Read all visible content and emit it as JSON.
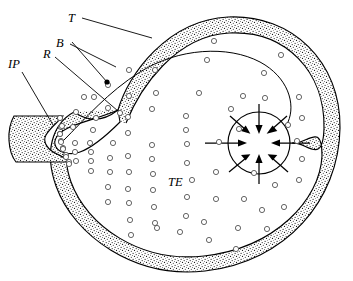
{
  "figure": {
    "background_color": "#ffffff",
    "ink_color": "#000000",
    "width": 353,
    "height": 281
  },
  "labels": [
    {
      "id": "T",
      "text": "T",
      "x": 68,
      "y": 22,
      "name": "label-t"
    },
    {
      "id": "B",
      "text": "B",
      "x": 56,
      "y": 47,
      "name": "label-b"
    },
    {
      "id": "R",
      "text": "R",
      "x": 43,
      "y": 58,
      "name": "label-r"
    },
    {
      "id": "IP",
      "text": "IP",
      "x": 8,
      "y": 68,
      "name": "label-ip"
    },
    {
      "id": "TE",
      "text": "TE",
      "x": 168,
      "y": 186,
      "name": "label-te"
    }
  ],
  "leaders": [
    {
      "id": "leader-t",
      "from_label": "T",
      "path": "M 82 18 L 152 38"
    },
    {
      "id": "leader-b",
      "from_label": "B",
      "path": "M 70 44 L 116 67"
    },
    {
      "id": "leader-r",
      "from_label": "R",
      "path": "M 55 57 L 118 111"
    },
    {
      "id": "leader-ip",
      "from_label": "IP",
      "path": "M 22 72 L 53 125"
    },
    {
      "id": "leader-dot",
      "from_label": "B",
      "path": "M 72 42 L 107 82",
      "end_dot": true
    }
  ],
  "structures": {
    "outer_coat": {
      "name": "outer-seed-coat",
      "texture": "stipple",
      "stipple_density": 2300
    },
    "integument_block": {
      "name": "integument-block-ip",
      "texture": "stipple"
    },
    "inner_membrane": {
      "name": "inner-membrane-line"
    },
    "nucleus": {
      "name": "nucleus-circle",
      "cx": 259,
      "cy": 143,
      "r": 31,
      "arrow_count": 8,
      "arrow_direction": "inward"
    },
    "micropyle": {
      "name": "micropyle-notch"
    }
  },
  "vesicles": {
    "name": "vesicle-dots",
    "radius": 2.6,
    "count": 84,
    "points": [
      [
        214,
        41
      ],
      [
        281,
        55
      ],
      [
        155,
        70
      ],
      [
        207,
        60
      ],
      [
        264,
        73
      ],
      [
        129,
        70
      ],
      [
        94,
        97
      ],
      [
        243,
        96
      ],
      [
        265,
        98
      ],
      [
        299,
        97
      ],
      [
        108,
        85
      ],
      [
        156,
        93
      ],
      [
        199,
        93
      ],
      [
        231,
        109
      ],
      [
        152,
        109
      ],
      [
        108,
        108
      ],
      [
        84,
        97
      ],
      [
        76,
        112
      ],
      [
        60,
        118
      ],
      [
        96,
        118
      ],
      [
        120,
        113
      ],
      [
        129,
        96
      ],
      [
        186,
        116
      ],
      [
        219,
        142
      ],
      [
        297,
        141
      ],
      [
        302,
        118
      ],
      [
        73,
        127
      ],
      [
        93,
        130
      ],
      [
        128,
        133
      ],
      [
        113,
        143
      ],
      [
        61,
        127
      ],
      [
        60,
        134
      ],
      [
        61,
        141
      ],
      [
        63,
        148
      ],
      [
        66,
        155
      ],
      [
        69,
        162
      ],
      [
        75,
        143
      ],
      [
        75,
        152
      ],
      [
        76,
        161
      ],
      [
        90,
        143
      ],
      [
        91,
        152
      ],
      [
        91,
        161
      ],
      [
        128,
        117
      ],
      [
        152,
        145
      ],
      [
        187,
        144
      ],
      [
        216,
        172
      ],
      [
        254,
        173
      ],
      [
        244,
        199
      ],
      [
        91,
        171
      ],
      [
        110,
        158
      ],
      [
        110,
        172
      ],
      [
        128,
        156
      ],
      [
        129,
        172
      ],
      [
        152,
        159
      ],
      [
        153,
        174
      ],
      [
        187,
        163
      ],
      [
        192,
        180
      ],
      [
        108,
        187
      ],
      [
        128,
        189
      ],
      [
        153,
        190
      ],
      [
        187,
        197
      ],
      [
        216,
        199
      ],
      [
        262,
        210
      ],
      [
        275,
        185
      ],
      [
        299,
        180
      ],
      [
        108,
        202
      ],
      [
        129,
        203
      ],
      [
        154,
        207
      ],
      [
        130,
        220
      ],
      [
        155,
        223
      ],
      [
        186,
        216
      ],
      [
        204,
        222
      ],
      [
        284,
        207
      ],
      [
        238,
        228
      ],
      [
        267,
        229
      ],
      [
        209,
        240
      ],
      [
        131,
        235
      ],
      [
        157,
        228
      ],
      [
        180,
        232
      ],
      [
        236,
        249
      ],
      [
        302,
        159
      ],
      [
        288,
        125
      ],
      [
        186,
        130
      ],
      [
        239,
        129
      ]
    ],
    "micropyle_stream": [
      [
        60,
        118
      ],
      [
        62,
        126
      ],
      [
        60,
        134
      ],
      [
        61,
        142
      ],
      [
        63,
        149
      ],
      [
        66,
        157
      ],
      [
        69,
        164
      ]
    ]
  }
}
